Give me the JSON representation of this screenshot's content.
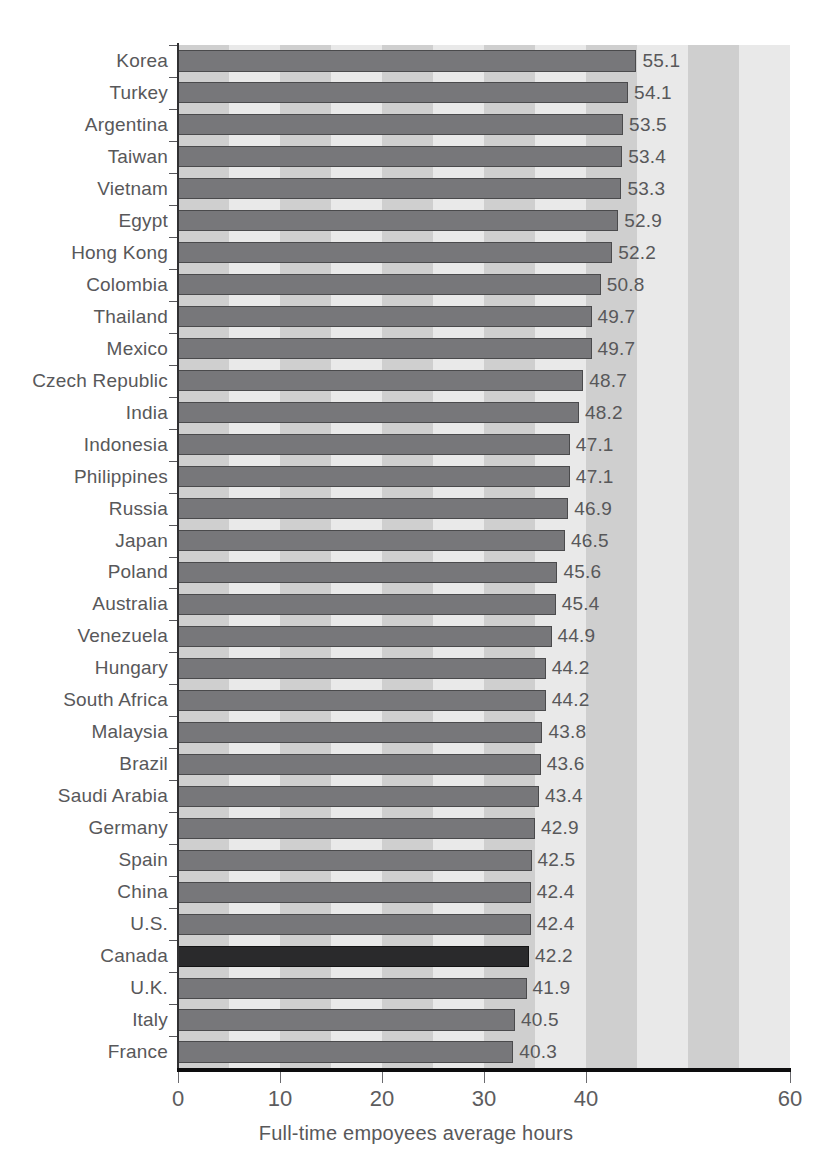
{
  "chart_data": {
    "type": "bar",
    "orientation": "horizontal",
    "title": "",
    "xlabel": "Full-time empoyees average hours",
    "ylabel": "",
    "xlim": [
      0,
      60
    ],
    "xticks": [
      0,
      10,
      20,
      30,
      40,
      60
    ],
    "xtick_labels": [
      "0",
      "10",
      "20",
      "30",
      "40",
      "60"
    ],
    "grid": false,
    "legend": null,
    "highlight_category": "Canada",
    "bar_color": "#77777a",
    "highlight_color": "#2a2a2c",
    "background_bands": true,
    "categories": [
      "Korea",
      "Turkey",
      "Argentina",
      "Taiwan",
      "Vietnam",
      "Egypt",
      "Hong Kong",
      "Colombia",
      "Thailand",
      "Mexico",
      "Czech Republic",
      "India",
      "Indonesia",
      "Philippines",
      "Russia",
      "Japan",
      "Poland",
      "Australia",
      "Venezuela",
      "Hungary",
      "South Africa",
      "Malaysia",
      "Brazil",
      "Saudi Arabia",
      "Germany",
      "Spain",
      "China",
      "U.S.",
      "Canada",
      "U.K.",
      "Italy",
      "France"
    ],
    "values": [
      55.1,
      54.1,
      53.5,
      53.4,
      53.3,
      52.9,
      52.2,
      50.8,
      49.7,
      49.7,
      48.7,
      48.2,
      47.1,
      47.1,
      46.9,
      46.5,
      45.6,
      45.4,
      44.9,
      44.2,
      44.2,
      43.8,
      43.6,
      43.4,
      42.9,
      42.5,
      42.4,
      42.4,
      42.2,
      41.9,
      40.5,
      40.3
    ],
    "value_labels": [
      "55.1",
      "54.1",
      "53.5",
      "53.4",
      "53.3",
      "52.9",
      "52.2",
      "50.8",
      "49.7",
      "49.7",
      "48.7",
      "48.2",
      "47.1",
      "47.1",
      "46.9",
      "46.5",
      "45.6",
      "45.4",
      "44.9",
      "44.2",
      "44.2",
      "43.8",
      "43.6",
      "43.4",
      "42.9",
      "42.5",
      "42.4",
      "42.4",
      "42.2",
      "41.9",
      "40.5",
      "40.3"
    ]
  }
}
